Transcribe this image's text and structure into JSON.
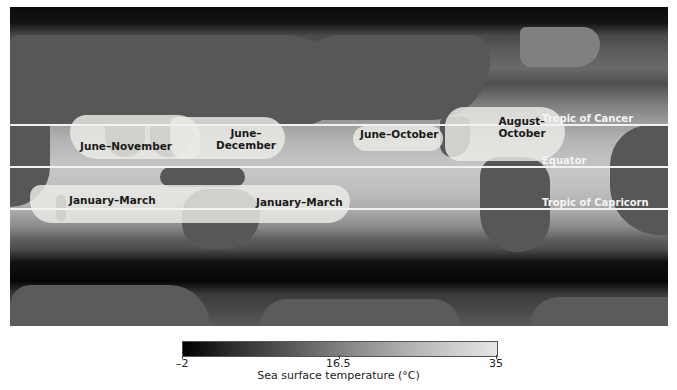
{
  "map": {
    "title": "Tropical cyclone seasons over sea surface temperature",
    "reference_lines": [
      {
        "label": "Tropic of Cancer",
        "y": 124
      },
      {
        "label": "Equator",
        "y": 166
      },
      {
        "label": "Tropic of Capricorn",
        "y": 208
      }
    ],
    "zones": [
      {
        "label": "June–November",
        "region": "North Indian Ocean"
      },
      {
        "label": "June–December",
        "region": "Western North Pacific"
      },
      {
        "label": "June–October",
        "region": "Eastern North Pacific"
      },
      {
        "label": "August–October",
        "region": "North Atlantic"
      },
      {
        "label": "January–March",
        "region": "South Indian Ocean"
      },
      {
        "label": "January–March",
        "region": "South Pacific"
      }
    ],
    "colors": {
      "zone_fill": "#ececE6",
      "lines": "#f2f2f2"
    }
  },
  "legend": {
    "min_label": "–2",
    "mid_label": "16.5",
    "max_label": "35",
    "title": "Sea surface temperature (°C)",
    "colormap": [
      "#000000",
      "#e6e6e6"
    ]
  }
}
